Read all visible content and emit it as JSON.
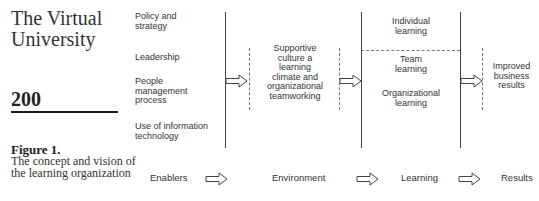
{
  "sidebar": {
    "journal_title_line1": "The Virtual",
    "journal_title_line2": "University",
    "page_number": "200",
    "figure_label": "Figure 1.",
    "figure_caption": "The concept and vision of the learning organization"
  },
  "diagram": {
    "enablers": [
      {
        "line1": "Policy and",
        "line2": "strategy"
      },
      {
        "line1": "Leadership",
        "line2": ""
      },
      {
        "line1": "People",
        "line2": "management",
        "line3": "process"
      },
      {
        "line1": "Use of information",
        "line2": "technology"
      }
    ],
    "environment_box": [
      "Supportive",
      "culture a",
      "learning",
      "climate and",
      "organizational",
      "teamworking"
    ],
    "learning_box": {
      "individual": [
        "Individual",
        "learning"
      ],
      "team": [
        "Team",
        "learning"
      ],
      "organizational": [
        "Organizational",
        "learning"
      ]
    },
    "results_box": [
      "Improved",
      "business",
      "results"
    ],
    "stages": [
      "Enablers",
      "Environment",
      "Learning",
      "Results"
    ],
    "colors": {
      "line": "#444444",
      "dashed": "#777777",
      "text": "#333333",
      "rule": "#1a1a1a"
    }
  }
}
